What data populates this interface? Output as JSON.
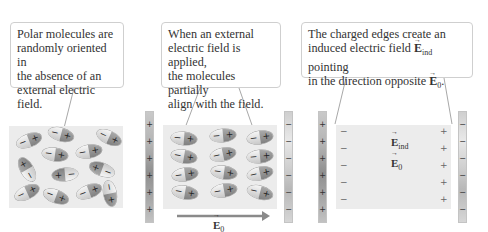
{
  "callouts": {
    "panel1": [
      "Polar molecules are",
      "randomly oriented in",
      "the absence of an",
      "external electric field."
    ],
    "panel2": [
      "When an external",
      "electric field is applied,",
      "the molecules partially",
      "align with the field."
    ],
    "panel3_line1": "The charged edges create an",
    "panel3_line2_pre": "induced electric field ",
    "panel3_line2_post": " pointing",
    "panel3_line3_pre": "in the direction opposite ",
    "panel3_line3_post": "."
  },
  "labels": {
    "E": "E",
    "sub_ind": "ind",
    "sub_0": "0"
  },
  "symbols": {
    "plus": "+",
    "minus": "−"
  },
  "colors": {
    "panel_bg": "#ececec",
    "arrow": "#8a8a8a",
    "callout_border": "#cfcfcf",
    "text": "#333333"
  }
}
